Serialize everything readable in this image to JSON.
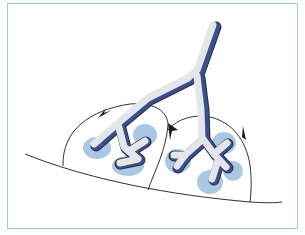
{
  "diagram": {
    "type": "anatomical-illustration",
    "colors": {
      "frame": "#9fcbe0",
      "airway_fill": "#e4e6ea",
      "airway_outline": "#2b2f3a",
      "airway_wall_accent": "#3a4f8f",
      "alveolar_cluster": "#a9c8e4",
      "outline": "#1a1a1a"
    },
    "elements": {
      "main_bronchus": "main-airway",
      "branches": [
        "left-branch",
        "right-branch"
      ],
      "lobules": [
        "left-lobule",
        "right-lobule"
      ],
      "alveolar_clusters_count": 6,
      "septal_junction_markers": 4
    }
  }
}
